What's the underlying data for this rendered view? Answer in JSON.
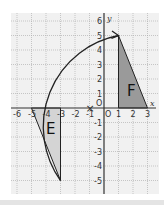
{
  "diagram": {
    "type": "coordinate-grid-rotation",
    "x_axis_label": "x",
    "y_axis_label": "y",
    "origin_label": "O",
    "x_range": [
      -6,
      3
    ],
    "y_range": [
      -5,
      6
    ],
    "x_ticks": [
      "-6",
      "-5",
      "-4",
      "-3",
      "-2",
      "-1",
      "1",
      "2",
      "3"
    ],
    "y_ticks": [
      "6",
      "5",
      "4",
      "3",
      "2",
      "1",
      "-1",
      "-2",
      "-3",
      "-4",
      "-5"
    ],
    "center_marker": {
      "symbol": "×",
      "x": -1,
      "y": 0
    },
    "shapes": [
      {
        "label": "F",
        "vertices": [
          [
            1,
            0
          ],
          [
            1,
            5
          ],
          [
            3,
            0
          ]
        ],
        "fill": "#9a9a9a"
      },
      {
        "label": "E",
        "vertices": [
          [
            -5,
            0
          ],
          [
            -3,
            0
          ],
          [
            -3,
            -5
          ]
        ],
        "fill": "#d4d4d4"
      }
    ],
    "arc": {
      "from": [
        1,
        5
      ],
      "to": [
        -3,
        -5
      ],
      "arrowhead_at": [
        1,
        5
      ]
    },
    "colors": {
      "grid": "#a8a8a8",
      "axes": "#333333",
      "background": "#f1f1f1"
    }
  }
}
